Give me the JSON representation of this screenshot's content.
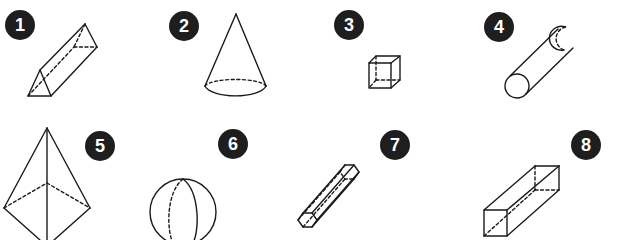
{
  "worksheet": {
    "shapes": [
      {
        "number": "1",
        "name": "triangular prism"
      },
      {
        "number": "2",
        "name": "cone"
      },
      {
        "number": "3",
        "name": "cube"
      },
      {
        "number": "4",
        "name": "cylinder"
      },
      {
        "number": "5",
        "name": "pyramid"
      },
      {
        "number": "6",
        "name": "sphere"
      },
      {
        "number": "7",
        "name": "hexagonal prism"
      },
      {
        "number": "8",
        "name": "rectangular prism"
      }
    ],
    "colors": {
      "badge": "#1e1e1e",
      "badge_text": "#ffffff",
      "line": "#1a1a1a"
    }
  }
}
